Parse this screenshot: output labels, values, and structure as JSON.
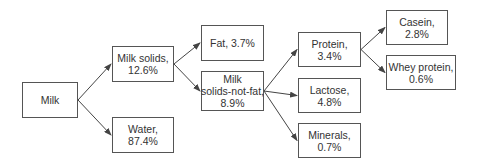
{
  "diagram": {
    "nodes": [
      {
        "id": "milk",
        "label": "Milk",
        "x": 22,
        "y": 82,
        "w": 56,
        "h": 36
      },
      {
        "id": "milk_solids",
        "label": "Milk solids,\n12.6%",
        "x": 112,
        "y": 46,
        "w": 62,
        "h": 36
      },
      {
        "id": "water",
        "label": "Water,\n87.4%",
        "x": 112,
        "y": 117,
        "w": 62,
        "h": 36
      },
      {
        "id": "fat",
        "label": "Fat, 3.7%",
        "x": 201,
        "y": 25,
        "w": 63,
        "h": 36
      },
      {
        "id": "msnf",
        "label": "Milk\nsolids-not-fat,\n8.9%",
        "x": 201,
        "y": 71,
        "w": 63,
        "h": 40
      },
      {
        "id": "protein",
        "label": "Protein,\n3.4%",
        "x": 298,
        "y": 32,
        "w": 63,
        "h": 35
      },
      {
        "id": "lactose",
        "label": "Lactose,\n4.8%",
        "x": 298,
        "y": 78,
        "w": 63,
        "h": 35
      },
      {
        "id": "minerals",
        "label": "Minerals,\n0.7%",
        "x": 298,
        "y": 123,
        "w": 63,
        "h": 35
      },
      {
        "id": "casein",
        "label": "Casein,\n2.8%",
        "x": 386,
        "y": 10,
        "w": 62,
        "h": 35
      },
      {
        "id": "whey",
        "label": "Whey protein,\n0.6%",
        "x": 386,
        "y": 55,
        "w": 70,
        "h": 35
      }
    ],
    "edges": [
      {
        "from": "milk",
        "to": "milk_solids"
      },
      {
        "from": "milk",
        "to": "water"
      },
      {
        "from": "milk_solids",
        "to": "fat"
      },
      {
        "from": "milk_solids",
        "to": "msnf"
      },
      {
        "from": "msnf",
        "to": "protein"
      },
      {
        "from": "msnf",
        "to": "lactose"
      },
      {
        "from": "msnf",
        "to": "minerals"
      },
      {
        "from": "protein",
        "to": "casein"
      },
      {
        "from": "protein",
        "to": "whey"
      }
    ],
    "colors": {
      "stroke": "#555555",
      "text": "#333333",
      "background": "#ffffff"
    }
  }
}
